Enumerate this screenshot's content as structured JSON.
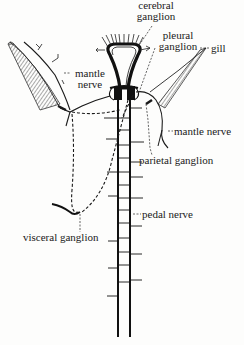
{
  "diagram": {
    "type": "anatomical-illustration",
    "colors": {
      "ink": "#1a1a1a",
      "background": "#fdfdfc"
    },
    "labels": {
      "cerebral_ganglion_line1": "cerebral",
      "cerebral_ganglion_line2": "ganglion",
      "pleural_ganglion_line1": "pleural",
      "pleural_ganglion_line2": "ganglion",
      "gill": "gill",
      "mantle_nerve_left_line1": "mantle",
      "mantle_nerve_left_line2": "nerve",
      "mantle_nerve_right": "mantle nerve",
      "parietal_ganglion": "parietal ganglion",
      "pedal_nerve": "pedal nerve",
      "visceral_ganglion": "visceral ganglion"
    },
    "structures": [
      "cerebral ganglion",
      "pleural ganglion",
      "gill (left)",
      "gill (right)",
      "mantle nerve (left)",
      "mantle nerve (right)",
      "parietal ganglion",
      "pedal nerve cords with commissures",
      "visceral ganglion",
      "visceral connectives (dashed)"
    ]
  }
}
